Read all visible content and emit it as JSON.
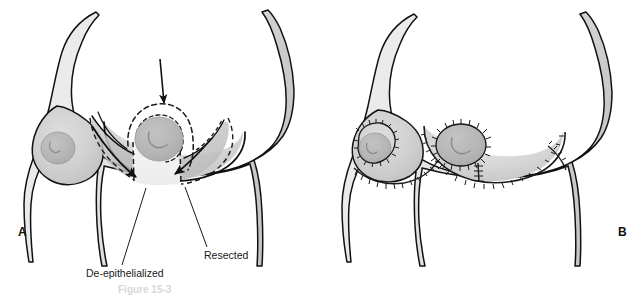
{
  "figure": {
    "caption_partial": "Figure 15-3",
    "background_color": "#ffffff",
    "outline_color": "#111111",
    "skin_fill_light": "#e7e7e7",
    "skin_fill_mid": "#d4d4d4",
    "skin_fill_dark": "#bdbdbd",
    "areola_fill": "#b4b4b4",
    "deepithelialized_fill": "#f2f2f2",
    "suture_color": "#1a1a1a"
  },
  "panels": [
    {
      "id": "A",
      "label": "A",
      "label_x": 18,
      "label_y": 236,
      "description": "Preoperative markings: dashed planned incision lines around areola and inframammary extensions, arrows indicating flap advancement",
      "annotations": [
        {
          "name": "de-epithelialized",
          "label": "De-epithelialized",
          "text_x": 86,
          "text_y": 277,
          "leader_from_x": 146,
          "leader_from_y": 188,
          "leader_to_x": 122,
          "leader_to_y": 264
        },
        {
          "name": "resected",
          "label": "Resected",
          "text_x": 204,
          "text_y": 259,
          "leader_from_x": 185,
          "leader_from_y": 187,
          "leader_to_x": 207,
          "leader_to_y": 246
        }
      ],
      "arrows": [
        {
          "name": "superior-advancement-arrow",
          "from_x": 160,
          "from_y": 60,
          "to_x": 164,
          "to_y": 105
        },
        {
          "name": "left-flap-arrow",
          "from_x": 93,
          "from_y": 128,
          "to_x": 139,
          "to_y": 178
        },
        {
          "name": "right-flap-arrow",
          "from_x": 210,
          "from_y": 140,
          "to_x": 172,
          "to_y": 176
        }
      ]
    },
    {
      "id": "B",
      "label": "B",
      "label_x": 618,
      "label_y": 236,
      "description": "Postoperative result: periareolar and vertical suture lines with inframammary closure",
      "annotations": [],
      "arrows": []
    }
  ]
}
